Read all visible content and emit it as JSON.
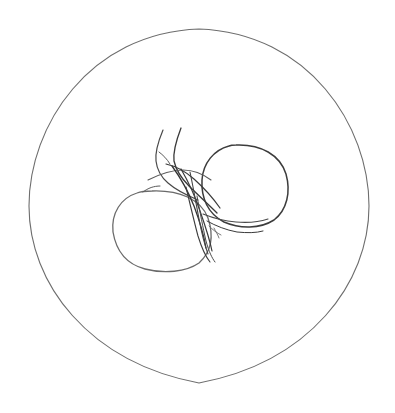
{
  "artwork": {
    "title": "Line drawing of two round fruits with stems inside a circle",
    "subject": "two-fruits-on-vine",
    "medium": "pen-line-sketch",
    "background_color": "#ffffff",
    "canvas": {
      "width": 395,
      "height": 413
    }
  },
  "colors": {
    "background": "#ffffff",
    "plate_outline": "#6d6d6d",
    "fruit_left_outline": "#6a6a6a",
    "fruit_right_outline": "#3c3c3c",
    "stem_dark": "#333333",
    "stem_mid": "#4a4a4a",
    "stem_light": "#6a6a6a"
  },
  "shapes": {
    "plate": {
      "label": "outer circle",
      "name": "plate-circle",
      "cx": 199,
      "cy": 206,
      "rx": 170,
      "ry": 177,
      "stroke_width": 1.1
    },
    "fruit_left": {
      "label": "left fruit",
      "name": "left-fruit",
      "cx": 162,
      "cy": 231,
      "rx": 49,
      "ry": 41,
      "stroke_width": 1.2
    },
    "fruit_right": {
      "label": "right fruit",
      "name": "right-fruit",
      "cx": 244,
      "cy": 186,
      "rx": 44,
      "ry": 41,
      "stroke_width": 1.4
    }
  },
  "paths": {
    "plate_outline": "M 369 206 C 369 283 310 362 199 383 C 88 362 29 283 29 206 C 29 126 89 33 199 29 C 309 33 369 126 369 206 Z",
    "fruit_left_outline": "M 152 191 C 179 190 201 199 208 218 C 214 236 211 252 199 263 C 186 272 164 274 145 269 C 126 264 116 250 113 232 C 111 213 121 198 137 193 C 142 191 147 191 152 191 Z",
    "fruit_right_outline": "M 236 145 C 261 144 280 155 286 174 C 291 192 287 210 274 220 C 260 229 240 229 224 222 C 208 214 201 198 202 180 C 203 163 214 150 229 146 C 231 145 234 145 236 145 Z",
    "stem_a": "M 163 130 C 158 142 155 152 156 161 C 157 170 161 177 168 183 C 176 190 186 195 198 200",
    "stem_b": "M 181 128 C 176 141 173 152 174 161 C 176 170 181 178 189 186 C 198 195 208 204 217 213",
    "stem_c": "M 166 164 C 175 166 185 171 194 179 C 204 188 213 198 220 208",
    "stem_d": "M 148 180 C 160 174 172 170 183 170 C 194 170 203 174 211 180",
    "stem_e": "M 172 166 C 180 177 188 191 194 206 C 200 222 204 236 206 248",
    "stem_f": "M 181 169 C 188 181 195 196 200 211 C 206 228 210 241 212 251",
    "stem_g": "M 190 172 C 193 186 196 203 199 219 C 202 235 205 246 208 254",
    "stem_h": "M 197 196 C 200 212 203 228 206 241 C 209 252 212 258 215 262",
    "stem_i": "M 186 187 C 190 204 194 221 198 236 C 202 249 206 257 210 262",
    "stem_j": "M 203 214 C 213 218 224 221 236 222 C 248 223 259 222 268 219",
    "stem_k": "M 207 221 C 216 226 226 230 237 232 C 247 233 256 233 263 231",
    "stem_l": "M 209 226 C 213 230 217 233 221 235",
    "stem_m": "M 214 228 C 216 232 218 235 219 238",
    "stem_n": "M 143 192 C 148 188 154 186 160 186",
    "stem_o": "M 159 152 C 163 155 167 159 170 164"
  },
  "accessibility": {
    "alt_text": "Minimal black ink line drawing of two round fruits joined by curving stems, enclosed in a large thin circle"
  }
}
